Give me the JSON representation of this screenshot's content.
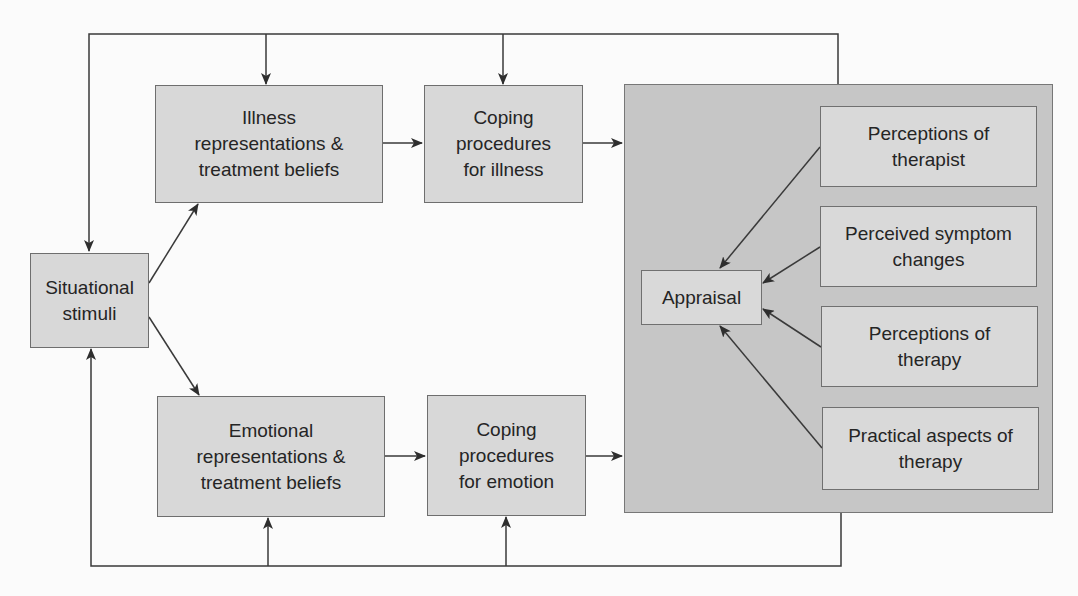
{
  "diagram": {
    "type": "flow diagram",
    "nodes": {
      "situational_stimuli": {
        "line1": "Situational",
        "line2": "stimuli"
      },
      "illness_representations": {
        "line1": "Illness",
        "line2": "representations &",
        "line3": "treatment beliefs"
      },
      "coping_illness": {
        "line1": "Coping",
        "line2": "procedures",
        "line3": "for illness"
      },
      "emotional_representations": {
        "line1": "Emotional",
        "line2": "representations &",
        "line3": "treatment beliefs"
      },
      "coping_emotion": {
        "line1": "Coping",
        "line2": "procedures",
        "line3": "for emotion"
      },
      "appraisal": {
        "label": "Appraisal"
      },
      "perceptions_therapist": {
        "line1": "Perceptions of",
        "line2": "therapist"
      },
      "perceived_symptom_changes": {
        "line1": "Perceived symptom",
        "line2": "changes"
      },
      "perceptions_therapy": {
        "line1": "Perceptions of",
        "line2": "therapy"
      },
      "practical_aspects": {
        "line1": "Practical aspects of",
        "line2": "therapy"
      }
    },
    "edges": [
      {
        "from": "situational_stimuli",
        "to": "illness_representations"
      },
      {
        "from": "situational_stimuli",
        "to": "emotional_representations"
      },
      {
        "from": "illness_representations",
        "to": "coping_illness"
      },
      {
        "from": "emotional_representations",
        "to": "coping_emotion"
      },
      {
        "from": "coping_illness",
        "to": "appraisal_group"
      },
      {
        "from": "coping_emotion",
        "to": "appraisal_group"
      },
      {
        "from": "perceptions_therapist",
        "to": "appraisal"
      },
      {
        "from": "perceived_symptom_changes",
        "to": "appraisal"
      },
      {
        "from": "perceptions_therapy",
        "to": "appraisal"
      },
      {
        "from": "practical_aspects",
        "to": "appraisal"
      },
      {
        "from": "appraisal_group",
        "to": "situational_stimuli",
        "via": "top feedback loop"
      },
      {
        "from": "appraisal_group",
        "to": "illness_representations",
        "via": "top feedback loop"
      },
      {
        "from": "appraisal_group",
        "to": "coping_illness",
        "via": "top feedback loop"
      },
      {
        "from": "appraisal_group",
        "to": "situational_stimuli",
        "via": "bottom feedback loop"
      },
      {
        "from": "appraisal_group",
        "to": "emotional_representations",
        "via": "bottom feedback loop"
      },
      {
        "from": "appraisal_group",
        "to": "coping_emotion",
        "via": "bottom feedback loop"
      }
    ],
    "colors": {
      "box_fill": "#d8d8d8",
      "group_fill": "#c6c6c6",
      "line": "#3a3a3a"
    }
  }
}
